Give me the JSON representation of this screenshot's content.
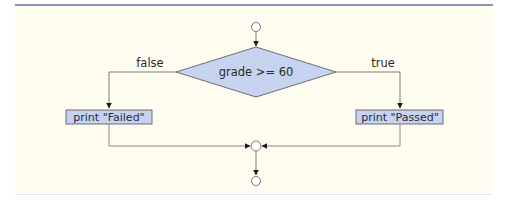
{
  "diagram": {
    "type": "flowchart",
    "title": "",
    "decision": {
      "label": "grade >= 60"
    },
    "branches": {
      "false": {
        "label": "false",
        "action": "print \"Failed\""
      },
      "true": {
        "label": "true",
        "action": "print \"Passed\""
      }
    },
    "nodes": [
      {
        "id": "start",
        "kind": "initial-circle"
      },
      {
        "id": "decision",
        "kind": "diamond",
        "text": "grade >= 60"
      },
      {
        "id": "failed",
        "kind": "action",
        "text": "print \"Failed\""
      },
      {
        "id": "passed",
        "kind": "action",
        "text": "print \"Passed\""
      },
      {
        "id": "merge",
        "kind": "merge-circle"
      },
      {
        "id": "end",
        "kind": "final-circle"
      }
    ],
    "edges": [
      {
        "from": "start",
        "to": "decision"
      },
      {
        "from": "decision",
        "to": "failed",
        "label": "false"
      },
      {
        "from": "decision",
        "to": "passed",
        "label": "true"
      },
      {
        "from": "failed",
        "to": "merge"
      },
      {
        "from": "passed",
        "to": "merge"
      },
      {
        "from": "merge",
        "to": "end"
      }
    ],
    "colors": {
      "background": "#fffdf0",
      "shape_fill": "#c5d3ee",
      "shape_stroke": "#6b6b7a",
      "line": "#8a8a8a",
      "rule": "#8f8fb5"
    }
  }
}
